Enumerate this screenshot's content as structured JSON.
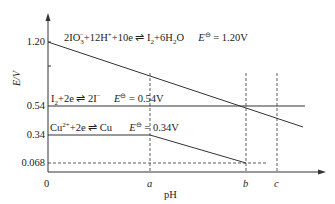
{
  "diagram": {
    "axes": {
      "y_label": "E/V",
      "x_label": "pH",
      "origin_label": "0",
      "y_ticks": [
        "1.20",
        "0.54",
        "0.34",
        "0.068"
      ],
      "x_ticks": [
        "a",
        "b",
        "c"
      ]
    },
    "reactions": [
      {
        "id": "iodate",
        "equation_left": "2IO",
        "equation_sub": "3",
        "equation_sup": "−",
        "equation_rest": "+12H",
        "equation_sup2": "+",
        "equation_rest2": "+10e ⇌ I",
        "equation_sub2": "2",
        "equation_rest3": "+6H",
        "equation_sub3": "2",
        "equation_rest4": "O",
        "potential_symbol": "E",
        "potential_sup": "⊖",
        "potential_value": " = 1.20V"
      },
      {
        "id": "iodine",
        "equation_left": "I",
        "equation_sub": "2",
        "equation_rest": "+2e ⇌ 2I",
        "equation_sup": "−",
        "potential_symbol": "E",
        "potential_sup": "⊖",
        "potential_value": " = 0.54V"
      },
      {
        "id": "copper",
        "equation_left": "Cu",
        "equation_sup": "2+",
        "equation_rest": "+2e ⇌ Cu",
        "potential_symbol": "E",
        "potential_sup": "⊖",
        "potential_value": " = 0.34V"
      }
    ],
    "colors": {
      "line": "#333333",
      "text": "#222222",
      "background": "#ffffff"
    }
  }
}
